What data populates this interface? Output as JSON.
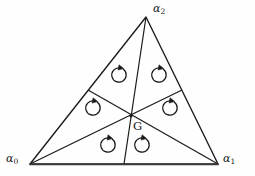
{
  "figure": {
    "type": "geometry-diagram",
    "background_color": "#fefefe",
    "stroke_color": "#1a1a1a",
    "vertices": [
      {
        "name": "alpha-0",
        "base": "α",
        "subscript": "0",
        "x": 30,
        "y": 164,
        "label_x": 6,
        "label_y": 153
      },
      {
        "name": "alpha-1",
        "base": "α",
        "subscript": "1",
        "x": 218,
        "y": 164,
        "label_x": 223,
        "label_y": 153
      },
      {
        "name": "alpha-2",
        "base": "α",
        "subscript": "2",
        "x": 146,
        "y": 17,
        "label_x": 153,
        "label_y": 3
      }
    ],
    "centroid": {
      "name": "G",
      "label": "G",
      "x": 131,
      "y": 116,
      "label_x": 133,
      "label_y": 121
    },
    "midpoints": [
      {
        "name": "midpoint-left",
        "x": 88,
        "y": 90
      },
      {
        "name": "midpoint-right",
        "x": 182,
        "y": 90
      },
      {
        "name": "midpoint-bottom",
        "x": 124,
        "y": 164
      }
    ],
    "arrows": [
      {
        "name": "orientation-arrow-top-left",
        "x": 119,
        "y": 75,
        "direction": "counterclockwise"
      },
      {
        "name": "orientation-arrow-top-right",
        "x": 159,
        "y": 75,
        "direction": "counterclockwise"
      },
      {
        "name": "orientation-arrow-left",
        "x": 93,
        "y": 108,
        "direction": "counterclockwise"
      },
      {
        "name": "orientation-arrow-right",
        "x": 170,
        "y": 108,
        "direction": "counterclockwise"
      },
      {
        "name": "orientation-arrow-bottom-left",
        "x": 108,
        "y": 145,
        "direction": "counterclockwise"
      },
      {
        "name": "orientation-arrow-bottom-right",
        "x": 142,
        "y": 145,
        "direction": "counterclockwise"
      }
    ]
  }
}
